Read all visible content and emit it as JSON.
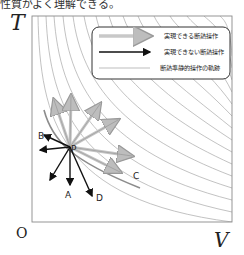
{
  "caption": "性質がよく理解できる。",
  "axes": {
    "y_label": "T",
    "x_label": "V",
    "origin_label": "O"
  },
  "legend": {
    "items": [
      {
        "label": "実現できる断熱操作",
        "style": "gray-arrow"
      },
      {
        "label": "実現できない断熱操作",
        "style": "black-arrow"
      },
      {
        "label": "断熱準静的操作の軌跡",
        "style": "thin-gray-line"
      }
    ]
  },
  "points": {
    "P": "P",
    "A": "A",
    "B": "B",
    "C": "C",
    "D": "D"
  },
  "colors": {
    "possible_arrow": "#c8c8c8",
    "impossible_arrow": "#111111",
    "curve": "#9a9a9a",
    "frame": "#888888"
  }
}
